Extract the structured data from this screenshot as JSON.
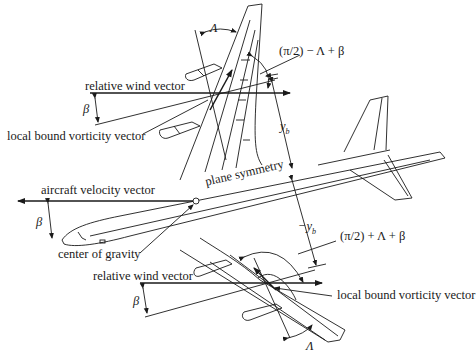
{
  "labels": {
    "relative_wind_top": "relative wind vector",
    "local_bound_vorticity_top": "local bound vorticity vector",
    "angle_top": "(π/2) − Λ + β",
    "yb": "y",
    "yb_sub": "b",
    "neg_yb": "−y",
    "neg_yb_sub": "b",
    "plane_symmetry": "plane symmetry",
    "aircraft_velocity": "aircraft velocity vector",
    "center_of_gravity": "center of gravity",
    "relative_wind_bottom": "relative wind vector",
    "local_bound_vorticity_bottom": "local bound vorticity vector",
    "angle_bottom": "(π/2) + Λ + β",
    "beta": "β",
    "lambda": "Λ"
  },
  "colors": {
    "stroke": "#1a1a1a",
    "background": "#ffffff"
  }
}
